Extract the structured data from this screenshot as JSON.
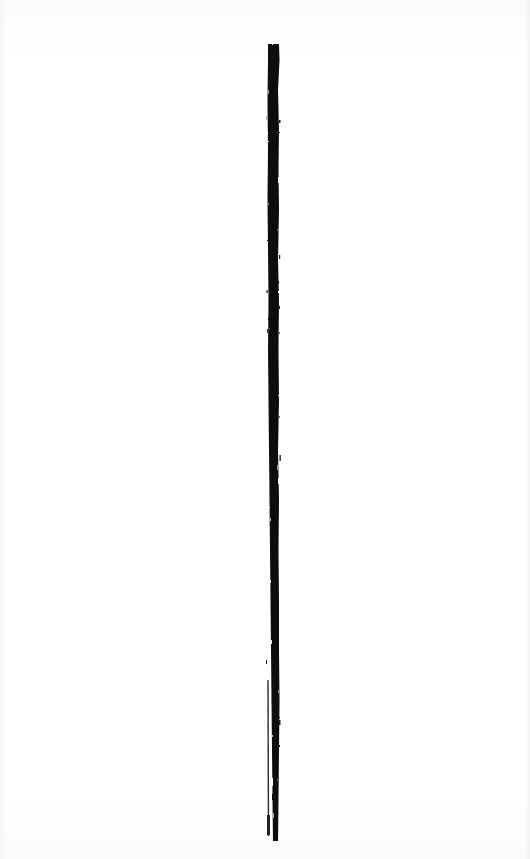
{
  "artwork": {
    "background_color": "#fdfdfd",
    "stroke_color": "#0d0d0d",
    "main_stroke": {
      "x_center": 273,
      "y_top": 44,
      "y_bottom": 841,
      "width_top": 11,
      "width_bottom": 7
    },
    "secondary_stroke": {
      "x": 268,
      "y_top": 680,
      "y_bottom": 836,
      "width": 1.5
    }
  }
}
